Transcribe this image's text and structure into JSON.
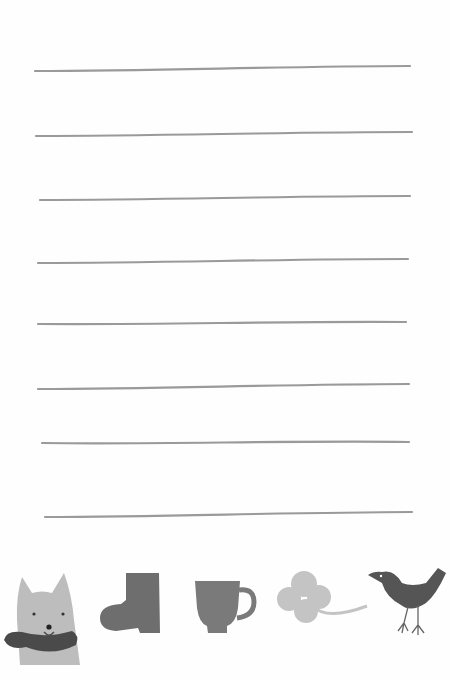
{
  "paper": {
    "background": "#fefefe",
    "line_color": "#9a9a9a",
    "lines": [
      {
        "x1": 35,
        "y1": 71,
        "x2": 410,
        "y2": 66
      },
      {
        "x1": 36,
        "y1": 136,
        "x2": 412,
        "y2": 132
      },
      {
        "x1": 40,
        "y1": 200,
        "x2": 410,
        "y2": 196
      },
      {
        "x1": 38,
        "y1": 263,
        "x2": 408,
        "y2": 259
      },
      {
        "x1": 38,
        "y1": 324,
        "x2": 406,
        "y2": 322
      },
      {
        "x1": 38,
        "y1": 389,
        "x2": 409,
        "y2": 384
      },
      {
        "x1": 42,
        "y1": 443,
        "x2": 409,
        "y2": 442
      },
      {
        "x1": 45,
        "y1": 517,
        "x2": 412,
        "y2": 512
      }
    ]
  },
  "illustrations": [
    {
      "name": "dog-with-scarf",
      "body_color": "#bdbdbd",
      "scarf_color": "#4a4a4a"
    },
    {
      "name": "boot",
      "color": "#6e6e6e"
    },
    {
      "name": "mug",
      "color": "#7a7a7a"
    },
    {
      "name": "four-leaf-clover",
      "color": "#c4c4c4"
    },
    {
      "name": "bird",
      "color": "#555555"
    }
  ]
}
